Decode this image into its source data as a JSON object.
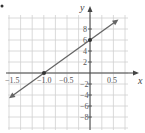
{
  "chart_data": {
    "type": "line",
    "title": "",
    "xlabel": "x",
    "ylabel": "y",
    "xlim": [
      -1.75,
      0.75
    ],
    "ylim": [
      -10,
      10
    ],
    "grid": true,
    "x_ticks": [
      -1.5,
      -1.0,
      -0.5,
      0.5
    ],
    "x_tick_labels": [
      "-1.5",
      "-1.0",
      "-0.5",
      "0.5"
    ],
    "y_ticks": [
      8,
      6,
      4,
      2,
      -2,
      -4,
      -6,
      -8
    ],
    "y_tick_labels": [
      "8",
      "6",
      "4",
      "2",
      "-2",
      "-4",
      "-6",
      "-8"
    ],
    "series": [
      {
        "name": "y = 6x + 6",
        "x": [
          -1.75,
          0.5
        ],
        "y": [
          -4.5,
          9
        ],
        "marked_points": [
          [
            -1.0,
            0
          ],
          [
            0,
            6
          ]
        ],
        "arrows_both_ends": true
      }
    ],
    "line_color": "#666666"
  },
  "labels": {
    "x_axis": "x",
    "y_axis": "y",
    "ticks_x": [
      "−1.5",
      "−1.0",
      "−0.5",
      "0.5"
    ],
    "ticks_y": [
      "8",
      "6",
      "4",
      "2",
      "−2",
      "−4",
      "−6",
      "−8"
    ]
  }
}
